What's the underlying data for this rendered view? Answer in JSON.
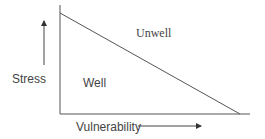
{
  "diagram": {
    "labels": {
      "y_axis": "Stress",
      "x_axis": "Vulnerability",
      "region_below": "Well",
      "region_above": "Unwell"
    },
    "colors": {
      "line": "#555555",
      "text": "#444444",
      "background": "#ffffff"
    },
    "shapes": {
      "y_axis_line": {
        "x": 60,
        "y1": 5,
        "y2": 114
      },
      "x_axis_line": {
        "x1": 60,
        "x2": 250,
        "y": 114
      },
      "threshold_line": {
        "x1": 60,
        "y1": 13,
        "x2": 240,
        "y2": 114
      },
      "stress_arrow": {
        "x": 44,
        "y1": 65,
        "y2": 20,
        "direction": "up"
      },
      "vulnerability_arrow": {
        "x1": 138,
        "x2": 202,
        "y": 126,
        "direction": "right"
      }
    }
  }
}
